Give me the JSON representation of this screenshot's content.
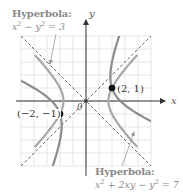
{
  "figure": {
    "type": "hyperbola-rotation-diagram",
    "axes": {
      "x_label": "x",
      "y_label": "y",
      "origin_label": "0"
    },
    "grid": {
      "x_range": [
        -5,
        5
      ],
      "y_range": [
        -5,
        5
      ],
      "unit_px": 13,
      "color": "#d9d9d9"
    },
    "asymptotes": [
      "y = x",
      "y = -x"
    ],
    "hyperbola_1": {
      "title": "Hyperbola:",
      "equation_html": "x<sup>2</sup> &minus; y<sup>2</sup> = 3",
      "equation_text": "x^2 - y^2 = 3",
      "color": "#a0a0a0"
    },
    "hyperbola_2": {
      "title": "Hyperbola:",
      "equation_html": "x<sup>2</sup> + 2xy &minus; y<sup>2</sup> = 7",
      "equation_text": "x^2 + 2xy - y^2 = 7",
      "color": "#8c8c8c"
    },
    "points": [
      {
        "label": "(2, 1)",
        "x": 2,
        "y": 1
      },
      {
        "label": "(−2, −1)",
        "x": -2,
        "y": -1
      }
    ],
    "colors": {
      "axis": "#444444",
      "point": "#111111",
      "text_gray": "#8a8a8a",
      "dashed": "#555555"
    }
  }
}
